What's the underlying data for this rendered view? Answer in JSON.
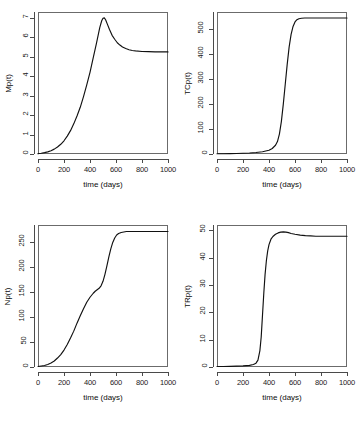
{
  "figure": {
    "background": "#ffffff",
    "curve_color": "#111111",
    "axis_color": "#4a4a4a",
    "layout": "2x2 grid of line plots"
  },
  "chart_data": [
    {
      "type": "line",
      "panel": "top-left",
      "title": "",
      "xlabel": "time (days)",
      "ylabel": "Mp(t)",
      "xlim": [
        0,
        1000
      ],
      "ylim": [
        0,
        7.3
      ],
      "xticks": [
        0,
        200,
        400,
        600,
        800,
        1000
      ],
      "xticklabels": [
        "0",
        "200",
        "400",
        "600",
        "800",
        "1000"
      ],
      "yticks": [
        0,
        1,
        2,
        3,
        4,
        5,
        6,
        7
      ],
      "yticklabels": [
        "0",
        "1",
        "2",
        "3",
        "4",
        "5",
        "6",
        "7"
      ],
      "grid": false,
      "legend": "none",
      "x": [
        0,
        25,
        50,
        75,
        100,
        125,
        150,
        175,
        200,
        225,
        250,
        275,
        300,
        325,
        350,
        375,
        400,
        425,
        450,
        475,
        490,
        500,
        510,
        520,
        535,
        550,
        570,
        590,
        610,
        630,
        650,
        675,
        700,
        725,
        750,
        800,
        850,
        900,
        950,
        1000
      ],
      "y": [
        0.02,
        0.04,
        0.07,
        0.11,
        0.17,
        0.25,
        0.36,
        0.5,
        0.68,
        0.92,
        1.2,
        1.55,
        1.95,
        2.4,
        2.95,
        3.55,
        4.2,
        4.95,
        5.7,
        6.5,
        6.85,
        6.98,
        7.0,
        6.9,
        6.65,
        6.4,
        6.1,
        5.9,
        5.72,
        5.6,
        5.5,
        5.42,
        5.36,
        5.32,
        5.3,
        5.27,
        5.26,
        5.25,
        5.25,
        5.25
      ]
    },
    {
      "type": "line",
      "panel": "top-right",
      "title": "",
      "xlabel": "time (days)",
      "ylabel": "TCp(t)",
      "xlim": [
        0,
        1000
      ],
      "ylim": [
        0,
        570
      ],
      "xticks": [
        0,
        200,
        400,
        600,
        800,
        1000
      ],
      "xticklabels": [
        "0",
        "200",
        "400",
        "600",
        "800",
        "1000"
      ],
      "yticks": [
        0,
        100,
        200,
        300,
        400,
        500
      ],
      "yticklabels": [
        "0",
        "100",
        "200",
        "300",
        "400",
        "500"
      ],
      "grid": false,
      "legend": "none",
      "x": [
        0,
        50,
        100,
        150,
        200,
        250,
        300,
        350,
        400,
        425,
        450,
        465,
        480,
        495,
        510,
        525,
        540,
        555,
        570,
        585,
        600,
        615,
        630,
        650,
        675,
        700,
        750,
        800,
        850,
        900,
        950,
        1000
      ],
      "y": [
        1,
        1,
        1.5,
        2,
        3,
        4,
        6,
        9,
        15,
        22,
        35,
        50,
        80,
        130,
        200,
        280,
        360,
        430,
        480,
        512,
        530,
        539,
        543,
        545,
        546,
        546,
        546,
        546,
        546,
        546,
        546,
        546
      ]
    },
    {
      "type": "line",
      "panel": "bottom-left",
      "title": "",
      "xlabel": "time (days)",
      "ylabel": "Np(t)",
      "xlim": [
        0,
        1000
      ],
      "ylim": [
        0,
        285
      ],
      "xticks": [
        0,
        200,
        400,
        600,
        800,
        1000
      ],
      "xticklabels": [
        "0",
        "200",
        "400",
        "600",
        "800",
        "1000"
      ],
      "yticks": [
        0,
        50,
        100,
        150,
        200,
        250
      ],
      "yticklabels": [
        "0",
        "50",
        "100",
        "150",
        "200",
        "250"
      ],
      "grid": false,
      "legend": "none",
      "x": [
        0,
        25,
        50,
        75,
        100,
        125,
        150,
        175,
        200,
        225,
        250,
        275,
        300,
        325,
        350,
        375,
        400,
        425,
        440,
        455,
        470,
        485,
        500,
        515,
        530,
        545,
        560,
        575,
        590,
        605,
        620,
        640,
        660,
        680,
        700,
        750,
        800,
        850,
        900,
        950,
        1000
      ],
      "y": [
        1,
        2,
        3,
        5,
        8,
        12,
        18,
        25,
        34,
        45,
        58,
        72,
        88,
        103,
        117,
        130,
        140,
        148,
        152,
        155,
        158,
        163,
        172,
        186,
        203,
        221,
        237,
        250,
        259,
        265,
        268,
        270,
        271,
        272,
        272,
        272,
        272,
        272,
        272,
        272,
        272
      ]
    },
    {
      "type": "line",
      "panel": "bottom-right",
      "title": "",
      "xlabel": "time (days)",
      "ylabel": "TRp(t)",
      "xlim": [
        0,
        1000
      ],
      "ylim": [
        0,
        52
      ],
      "xticks": [
        0,
        200,
        400,
        600,
        800,
        1000
      ],
      "xticklabels": [
        "0",
        "200",
        "400",
        "600",
        "800",
        "1000"
      ],
      "yticks": [
        0,
        10,
        20,
        30,
        40,
        50
      ],
      "yticklabels": [
        "0",
        "10",
        "20",
        "30",
        "40",
        "50"
      ],
      "grid": false,
      "legend": "none",
      "x": [
        0,
        50,
        100,
        150,
        200,
        250,
        280,
        300,
        315,
        330,
        340,
        350,
        360,
        370,
        380,
        390,
        400,
        415,
        430,
        450,
        470,
        490,
        510,
        530,
        550,
        570,
        600,
        640,
        680,
        720,
        760,
        800,
        850,
        900,
        950,
        1000
      ],
      "y": [
        0.2,
        0.2,
        0.25,
        0.3,
        0.4,
        0.6,
        0.9,
        1.4,
        2.5,
        6,
        11,
        19,
        27,
        34,
        39,
        42.5,
        44.8,
        46.8,
        47.8,
        48.6,
        49.1,
        49.4,
        49.5,
        49.4,
        49.2,
        48.9,
        48.6,
        48.3,
        48.1,
        48.0,
        47.9,
        47.9,
        47.9,
        47.9,
        47.9,
        47.9
      ]
    }
  ]
}
